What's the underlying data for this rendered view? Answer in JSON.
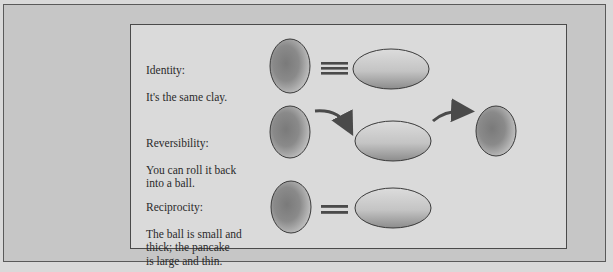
{
  "figure": {
    "rows": [
      {
        "id": "identity",
        "title": "Identity:",
        "description": "It's the same clay.",
        "relation": "identical-to",
        "shapes": [
          "ball",
          "pancake"
        ]
      },
      {
        "id": "reversibility",
        "title": "Reversibility:",
        "description": "You can roll it back\ninto a ball.",
        "relation": "transforms-to",
        "shapes": [
          "ball",
          "pancake",
          "ball"
        ]
      },
      {
        "id": "reciprocity",
        "title": "Reciprocity:",
        "description": "The ball is small and\nthick; the pancake\nis large and thin.",
        "relation": "equals",
        "shapes": [
          "ball",
          "pancake"
        ]
      }
    ],
    "colors": {
      "outer_background": "#c6c6c6",
      "panel_background": "#dadada",
      "border": "#4a4a4a",
      "clay_dark": "#6e6e6e",
      "clay_light": "#e4e4e4",
      "arrow": "#4a4a4a",
      "text": "#2a2a2a"
    }
  }
}
